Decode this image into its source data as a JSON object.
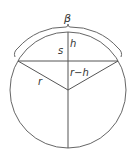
{
  "diagram": {
    "type": "circular-segment",
    "labels": {
      "beta": "β",
      "s": "s",
      "h": "h",
      "r": "r",
      "r_minus_h": "r−h"
    },
    "colors": {
      "stroke": "#555555",
      "text": "#333333",
      "background": "#ffffff"
    }
  }
}
